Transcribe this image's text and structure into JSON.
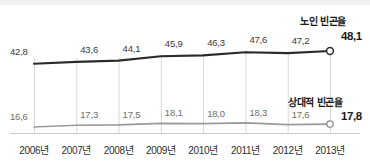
{
  "chart_data": {
    "type": "line",
    "title": "",
    "xlabel": "",
    "ylabel": "",
    "categories": [
      "2006년",
      "2007년",
      "2008년",
      "2009년",
      "2010년",
      "2011년",
      "2012년",
      "2013년"
    ],
    "grid": "vertical",
    "legend_position": "inline-right-end",
    "ylim": [
      0,
      55
    ],
    "series": [
      {
        "name": "노인 빈곤율",
        "color": "#2b2b2b",
        "values": [
          42.8,
          43.6,
          44.1,
          45.9,
          46.3,
          47.6,
          47.2,
          48.1
        ],
        "labels": [
          "42,8",
          "43,6",
          "44,1",
          "45,9",
          "46,3",
          "47,6",
          "47,2",
          "48,1"
        ],
        "end_label": "48,1",
        "end_marker": "open-circle"
      },
      {
        "name": "상대적 빈곤율",
        "color": "#9a9a9a",
        "values": [
          16.6,
          17.3,
          17.5,
          18.1,
          18.0,
          18.3,
          17.6,
          17.8
        ],
        "labels": [
          "16,6",
          "17,3",
          "17,5",
          "18,1",
          "18,0",
          "18,3",
          "17,6",
          "17,8"
        ],
        "end_label": "17,8",
        "end_marker": "open-circle"
      }
    ]
  },
  "axis": {
    "ticks": [
      "2006년",
      "2007년",
      "2008년",
      "2009년",
      "2010년",
      "2011년",
      "2012년",
      "2013년"
    ]
  },
  "legend": {
    "upper_series_label": "노인 빈곤율",
    "lower_series_label": "상대적 빈곤율"
  },
  "colors": {
    "upper_line": "#2b2b2b",
    "lower_line": "#9a9a9a",
    "gridline": "#d8d8d8",
    "baseline": "#c9c9c9",
    "background": "#ffffff",
    "top_band": "#f2f2f2"
  }
}
